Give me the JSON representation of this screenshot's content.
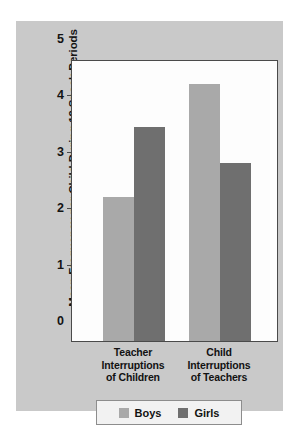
{
  "chart_data": {
    "type": "bar",
    "title": "",
    "subtitle": "",
    "xlabel": "",
    "ylabel": "Mean Frequency per Child During 19 Snack Periods",
    "ylim": [
      0,
      5
    ],
    "yticks": [
      "0",
      "1",
      "2",
      "3",
      "4",
      "5"
    ],
    "grid": false,
    "legend_position": "bottom",
    "categories": [
      "Teacher Interruptions of Children",
      "Child Interruptions of Teachers"
    ],
    "category_lines": [
      [
        "Teacher",
        "Interruptions",
        "of Children"
      ],
      [
        "Child",
        "Interruptions",
        "of Teachers"
      ]
    ],
    "series": [
      {
        "name": "Boys",
        "color": "#a9a9a9",
        "values": [
          2.55,
          4.55
        ]
      },
      {
        "name": "Girls",
        "color": "#6f6f6f",
        "values": [
          3.8,
          3.15
        ]
      }
    ]
  },
  "legend": {
    "entries": [
      {
        "label": "Boys",
        "swatch_color": "#a9a9a9"
      },
      {
        "label": "Girls",
        "swatch_color": "#6f6f6f"
      }
    ]
  },
  "colors": {
    "page_background": "#ffffff",
    "panel_background": "#c9c9c9",
    "plot_background": "#fdfdfd",
    "axis": "#4a4a4a",
    "text": "#131313",
    "boys": "#a9a9a9",
    "girls": "#6f6f6f"
  }
}
